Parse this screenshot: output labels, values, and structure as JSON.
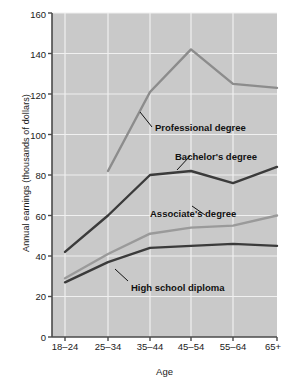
{
  "chart_data": {
    "type": "line",
    "title": "",
    "xlabel": "Age",
    "ylabel": "Annual earnings (thousands of dollars)",
    "categories": [
      "18–24",
      "25–34",
      "35–44",
      "45–54",
      "55–64",
      "65+"
    ],
    "ylim": [
      0,
      160
    ],
    "yticks": [
      0,
      20,
      40,
      60,
      80,
      100,
      120,
      140,
      160
    ],
    "ytick_labels": [
      "0",
      "20",
      "40",
      "60",
      "80",
      "100",
      "120",
      "140",
      "160"
    ],
    "grid": true,
    "legend": "inline-annotations",
    "series": [
      {
        "name": "Professional degree",
        "color": "#8c8c8c",
        "values": [
          null,
          82,
          121,
          142,
          125,
          123
        ]
      },
      {
        "name": "Bachelor's degree",
        "color": "#3b3b3b",
        "values": [
          42,
          60,
          80,
          82,
          76,
          84
        ]
      },
      {
        "name": "Associate's degree",
        "color": "#9a9a9a",
        "values": [
          29,
          41,
          51,
          54,
          55,
          60
        ]
      },
      {
        "name": "High school diploma",
        "color": "#3b3b3b",
        "values": [
          27,
          37,
          44,
          45,
          46,
          45
        ]
      }
    ],
    "annotations": [
      {
        "text": "Professional degree",
        "x": 155,
        "y": 122
      },
      {
        "text": "Bachelor's degree",
        "x": 175,
        "y": 151
      },
      {
        "text": "Associate's degree",
        "x": 150,
        "y": 208
      },
      {
        "text": "High school diploma",
        "x": 131,
        "y": 282
      }
    ],
    "plot_bg": "#c9c9c9",
    "grid_color": "#f0f0f0"
  }
}
